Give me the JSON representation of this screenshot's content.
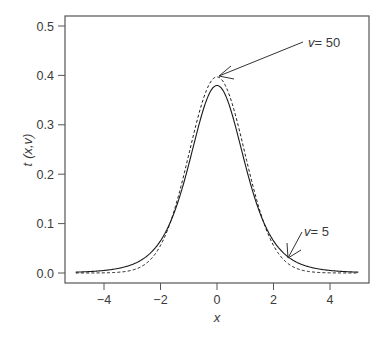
{
  "chart_data": {
    "type": "line",
    "title": "",
    "xlabel": "x",
    "ylabel": "t (x,v)",
    "xlim": [
      -5,
      5
    ],
    "ylim": [
      0,
      0.5
    ],
    "xticks": [
      -4,
      -2,
      0,
      2,
      4
    ],
    "xtick_labels": [
      "−4",
      "−2",
      "0",
      "2",
      "4"
    ],
    "yticks": [
      0.0,
      0.1,
      0.2,
      0.3,
      0.4,
      0.5
    ],
    "ytick_labels": [
      "0.0",
      "0.1",
      "0.2",
      "0.3",
      "0.4",
      "0.5"
    ],
    "grid": false,
    "legend": "none (inline annotations with arrows)",
    "series": [
      {
        "name": "v = 5",
        "style": "solid",
        "df": 5,
        "x": [
          -5,
          -4,
          -3,
          -2,
          -1,
          0,
          1,
          2,
          3,
          4,
          5
        ],
        "values": [
          0.0018,
          0.0051,
          0.0173,
          0.0651,
          0.2197,
          0.3796,
          0.2197,
          0.0651,
          0.0173,
          0.0051,
          0.0018
        ]
      },
      {
        "name": "v = 50",
        "style": "dashed",
        "df": 50,
        "x": [
          -5,
          -4,
          -3,
          -2,
          -1,
          0,
          1,
          2,
          3,
          4,
          5
        ],
        "values": [
          0.0,
          0.0002,
          0.0054,
          0.0552,
          0.2396,
          0.3969,
          0.2396,
          0.0552,
          0.0054,
          0.0002,
          0.0
        ]
      }
    ],
    "annotations": [
      {
        "text": "v = 50",
        "label_at": [
          3.35,
          0.402
        ],
        "arrow_to": [
          0.05,
          0.397
        ]
      },
      {
        "text": "v = 5",
        "label_at": [
          2.95,
          0.058
        ],
        "arrow_to": [
          2.5,
          0.032
        ]
      }
    ]
  },
  "labels": {
    "xlabel": "x",
    "ylabel_t": "t",
    "ylabel_args": "(x,v)",
    "ann50_v": "v",
    "ann50_eq": "= 50",
    "ann5_v": "v",
    "ann5_eq": "= 5"
  },
  "colors": {
    "axis": "#555555",
    "curve": "#1a1a1a",
    "text": "#3a3a3a",
    "background": "#ffffff"
  }
}
